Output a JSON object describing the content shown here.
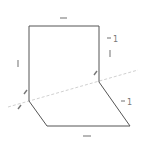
{
  "diagram": {
    "type": "folded-rectangle-geometry",
    "colors": {
      "stroke": "#555555",
      "fold_line": "#bbbbbb",
      "mark": "#888888"
    },
    "labels": {
      "right_top_ratio": "1",
      "right_bottom_ratio": "1"
    },
    "marks": {
      "top_edge": "equal-bar",
      "bottom_edge": "equal-bar",
      "left_edge": "single-tick",
      "right_upper_edge": "single-tick",
      "right_corner": "angle-mark",
      "left_corner_upper": "angle-mark",
      "left_corner_lower": "angle-mark"
    }
  }
}
